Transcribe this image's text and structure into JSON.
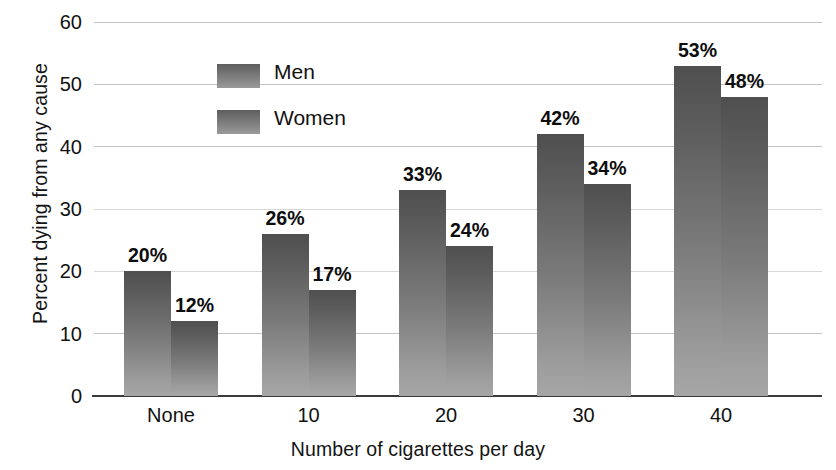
{
  "chart_data": {
    "type": "bar",
    "title": "",
    "xlabel": "Number of cigarettes per day",
    "ylabel": "Percent dying from any cause",
    "categories": [
      "None",
      "10",
      "20",
      "30",
      "40"
    ],
    "series": [
      {
        "name": "Men",
        "values": [
          20,
          26,
          33,
          42,
          53
        ],
        "color": "#6f6f6f"
      },
      {
        "name": "Women",
        "values": [
          12,
          17,
          24,
          34,
          48
        ],
        "color": "#6f6f6f"
      }
    ],
    "data_labels": {
      "Men": [
        "20%",
        "26%",
        "33%",
        "42%",
        "53%"
      ],
      "Women": [
        "12%",
        "17%",
        "24%",
        "34%",
        "48%"
      ]
    },
    "ylim": [
      0,
      60
    ],
    "yticks": [
      0,
      10,
      20,
      30,
      40,
      50,
      60
    ],
    "ytick_labels": [
      "0",
      "10",
      "20",
      "30",
      "40",
      "50",
      "60"
    ],
    "grid": true,
    "legend_position": "top-left-inside",
    "legend_entries": [
      "Men",
      "Women"
    ]
  },
  "axes": {
    "y_title": "Percent dying from any cause",
    "x_title": "Number of cigarettes per day"
  },
  "legend": {
    "items": [
      {
        "label": "Men"
      },
      {
        "label": "Women"
      }
    ]
  }
}
